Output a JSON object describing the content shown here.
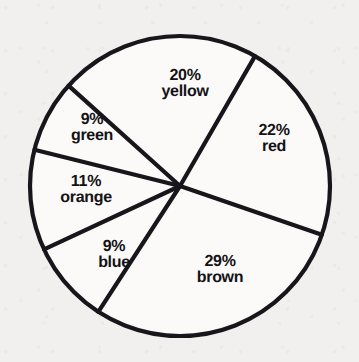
{
  "chart_data": {
    "type": "pie",
    "title": "",
    "subtitle": "",
    "xlabel": "",
    "ylabel": "",
    "legend_position": "none",
    "grid": false,
    "units": "percent",
    "total": 100,
    "categories": [
      "yellow",
      "red",
      "brown",
      "blue",
      "orange",
      "green"
    ],
    "values": [
      20,
      22,
      29,
      9,
      11,
      9
    ],
    "slices": [
      {
        "name": "yellow",
        "label_name": "yellow",
        "value": 20,
        "label_pct": "20%",
        "start_angle": -138,
        "end_angle": -60,
        "label_x": 185,
        "label_y": 84
      },
      {
        "name": "red",
        "label_name": "red",
        "value": 22,
        "label_pct": "22%",
        "start_angle": -60,
        "end_angle": 19,
        "label_x": 274,
        "label_y": 139
      },
      {
        "name": "brown",
        "label_name": "brown",
        "value": 29,
        "label_pct": "29%",
        "start_angle": 19,
        "end_angle": 123,
        "label_x": 220,
        "label_y": 270
      },
      {
        "name": "blue",
        "label_name": "blue",
        "value": 9,
        "label_pct": "9%",
        "start_angle": 123,
        "end_angle": 155,
        "label_x": 114,
        "label_y": 255
      },
      {
        "name": "orange",
        "label_name": "orange",
        "value": 11,
        "label_pct": "11%",
        "start_angle": 155,
        "end_angle": 194,
        "label_x": 86,
        "label_y": 190
      },
      {
        "name": "green",
        "label_name": "green",
        "value": 9,
        "label_pct": "9%",
        "start_angle": 194,
        "end_angle": 222,
        "label_x": 92,
        "label_y": 128
      }
    ],
    "geometry": {
      "center_x": 180,
      "center_y": 186,
      "radius": 150
    },
    "colors": {
      "background": "#f1f0ee",
      "slice_fill": "#fbfaf8",
      "outline": "#17161a",
      "label_text": "#131216"
    }
  }
}
